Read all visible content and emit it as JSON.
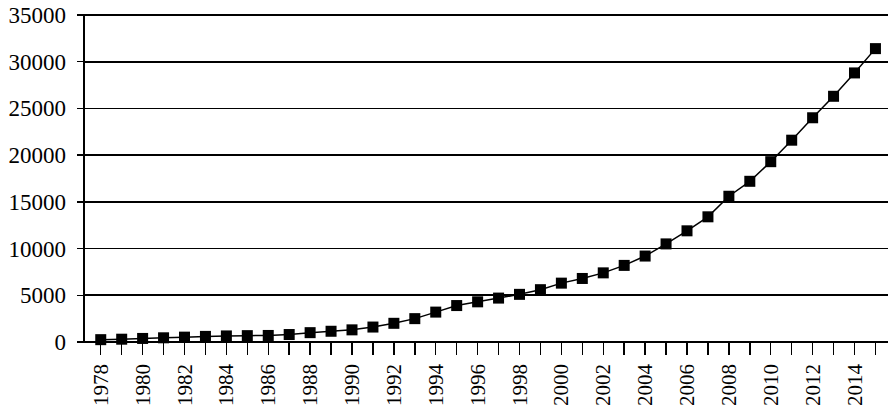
{
  "chart_data": {
    "type": "line",
    "title": "",
    "subtitle": "",
    "xlabel": "",
    "ylabel": "",
    "grid": true,
    "legend": false,
    "legend_position": "none",
    "marker": "filled-square",
    "line_color": "#000000",
    "marker_color": "#000000",
    "background_color": "#ffffff",
    "xlim": [
      1977.2,
      2015.6
    ],
    "ylim": [
      0,
      35000
    ],
    "y_ticks": [
      0,
      5000,
      10000,
      15000,
      20000,
      25000,
      30000,
      35000
    ],
    "y_tick_labels": [
      "0",
      "5000",
      "10000",
      "15000",
      "20000",
      "25000",
      "30000",
      "35000"
    ],
    "x_tick_labels": [
      "1978",
      "1980",
      "1982",
      "1984",
      "1986",
      "1988",
      "1990",
      "1992",
      "1994",
      "1996",
      "1998",
      "2000",
      "2002",
      "2004",
      "2006",
      "2008",
      "2010",
      "2012",
      "2014"
    ],
    "x_tick_label_rotation": -90,
    "x_minor_ticks_every": 1,
    "x": [
      1978,
      1979,
      1980,
      1981,
      1982,
      1983,
      1984,
      1985,
      1986,
      1987,
      1988,
      1989,
      1990,
      1991,
      1992,
      1993,
      1994,
      1995,
      1996,
      1997,
      1998,
      1999,
      2000,
      2001,
      2002,
      2003,
      2004,
      2005,
      2006,
      2007,
      2008,
      2009,
      2010,
      2011,
      2012,
      2013,
      2014,
      2015
    ],
    "values": [
      250,
      300,
      380,
      450,
      520,
      600,
      650,
      680,
      700,
      800,
      1000,
      1150,
      1300,
      1600,
      2000,
      2500,
      3200,
      3900,
      4300,
      4700,
      5100,
      5600,
      6300,
      6800,
      7400,
      8200,
      9200,
      10500,
      11900,
      13400,
      15600,
      17200,
      19300,
      21600,
      24000,
      26300,
      28800,
      31400
    ]
  }
}
